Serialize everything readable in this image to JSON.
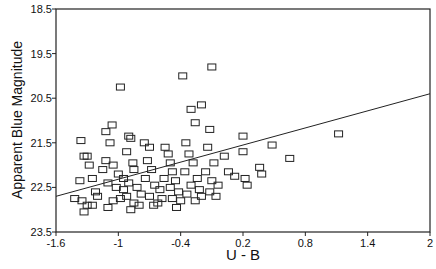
{
  "chart_data": {
    "type": "scatter",
    "title": "",
    "xlabel": "U - B",
    "ylabel": "Apparent Blue Magnitude",
    "xlim": [
      -1.6,
      2
    ],
    "ylim": [
      23.5,
      18.5
    ],
    "y_inverted": true,
    "grid": false,
    "x_ticks": [
      "-1.6",
      "-1",
      "-0.4",
      "0.2",
      "0.8",
      "1.4",
      "2"
    ],
    "y_ticks": [
      "18.5",
      "19.5",
      "20.5",
      "21.5",
      "22.5",
      "23.5"
    ],
    "marker": "open-square",
    "fit_line": {
      "x": [
        -1.6,
        2
      ],
      "y": [
        22.7,
        20.4
      ]
    },
    "points": [
      [
        -1.36,
        21.45
      ],
      [
        -1.33,
        21.8
      ],
      [
        -1.3,
        21.8
      ],
      [
        -1.28,
        22.0
      ],
      [
        -1.25,
        22.3
      ],
      [
        -1.37,
        22.35
      ],
      [
        -1.42,
        22.75
      ],
      [
        -1.35,
        22.8
      ],
      [
        -1.3,
        22.9
      ],
      [
        -1.25,
        22.9
      ],
      [
        -1.33,
        23.05
      ],
      [
        -1.22,
        22.6
      ],
      [
        -1.2,
        22.7
      ],
      [
        -1.12,
        21.25
      ],
      [
        -1.06,
        21.1
      ],
      [
        -1.08,
        21.5
      ],
      [
        -1.12,
        21.9
      ],
      [
        -1.15,
        22.1
      ],
      [
        -1.05,
        22.0
      ],
      [
        -1.0,
        22.2
      ],
      [
        -1.1,
        22.4
      ],
      [
        -1.02,
        22.5
      ],
      [
        -0.95,
        22.55
      ],
      [
        -0.98,
        22.75
      ],
      [
        -1.05,
        22.8
      ],
      [
        -1.1,
        22.95
      ],
      [
        -0.9,
        21.35
      ],
      [
        -0.88,
        21.4
      ],
      [
        -0.92,
        21.7
      ],
      [
        -0.86,
        21.95
      ],
      [
        -0.85,
        22.1
      ],
      [
        -0.95,
        22.3
      ],
      [
        -0.9,
        22.4
      ],
      [
        -0.82,
        22.5
      ],
      [
        -0.78,
        22.65
      ],
      [
        -0.85,
        22.85
      ],
      [
        -0.88,
        23.0
      ],
      [
        -0.8,
        22.9
      ],
      [
        -0.92,
        22.7
      ],
      [
        -0.98,
        20.25
      ],
      [
        -0.75,
        21.5
      ],
      [
        -0.7,
        21.6
      ],
      [
        -0.72,
        21.9
      ],
      [
        -0.68,
        22.1
      ],
      [
        -0.74,
        22.3
      ],
      [
        -0.65,
        22.45
      ],
      [
        -0.6,
        22.55
      ],
      [
        -0.7,
        22.7
      ],
      [
        -0.62,
        22.85
      ],
      [
        -0.66,
        22.9
      ],
      [
        -0.58,
        22.75
      ],
      [
        -0.55,
        21.6
      ],
      [
        -0.52,
        21.75
      ],
      [
        -0.5,
        21.95
      ],
      [
        -0.48,
        22.15
      ],
      [
        -0.56,
        22.3
      ],
      [
        -0.45,
        22.35
      ],
      [
        -0.5,
        22.5
      ],
      [
        -0.42,
        22.6
      ],
      [
        -0.48,
        22.75
      ],
      [
        -0.4,
        22.8
      ],
      [
        -0.44,
        22.95
      ],
      [
        -0.38,
        20.0
      ],
      [
        -0.3,
        20.75
      ],
      [
        -0.26,
        21.05
      ],
      [
        -0.35,
        21.5
      ],
      [
        -0.32,
        21.75
      ],
      [
        -0.28,
        21.95
      ],
      [
        -0.36,
        22.15
      ],
      [
        -0.24,
        22.3
      ],
      [
        -0.3,
        22.45
      ],
      [
        -0.22,
        22.55
      ],
      [
        -0.34,
        22.65
      ],
      [
        -0.26,
        22.8
      ],
      [
        -0.2,
        22.7
      ],
      [
        -0.2,
        20.65
      ],
      [
        -0.1,
        19.8
      ],
      [
        -0.12,
        21.2
      ],
      [
        -0.14,
        21.6
      ],
      [
        -0.08,
        21.95
      ],
      [
        -0.16,
        22.15
      ],
      [
        -0.1,
        22.35
      ],
      [
        -0.04,
        22.45
      ],
      [
        -0.12,
        22.6
      ],
      [
        -0.06,
        22.7
      ],
      [
        0.02,
        21.8
      ],
      [
        0.06,
        22.15
      ],
      [
        0.12,
        22.25
      ],
      [
        0.2,
        21.35
      ],
      [
        0.2,
        21.7
      ],
      [
        0.22,
        22.3
      ],
      [
        0.24,
        22.45
      ],
      [
        0.36,
        22.05
      ],
      [
        0.38,
        22.2
      ],
      [
        0.48,
        21.55
      ],
      [
        0.65,
        21.85
      ],
      [
        1.12,
        21.3
      ]
    ]
  },
  "caption": "Fig. 3.—Color-magnitude diagram"
}
